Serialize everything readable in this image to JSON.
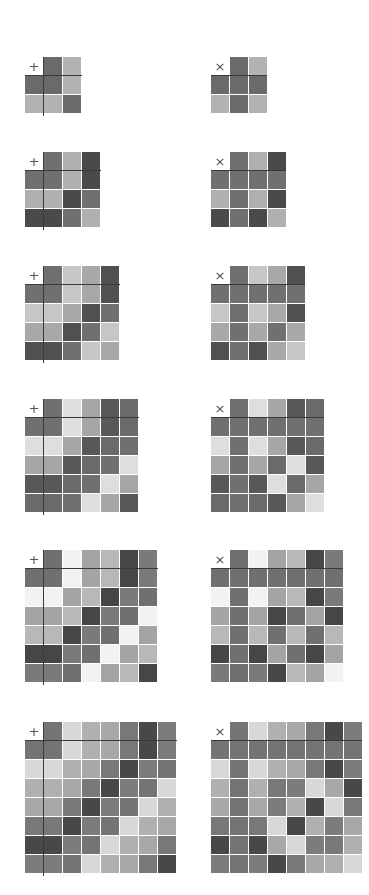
{
  "layout": {
    "columns_x": [
      25,
      211
    ],
    "rows_y": [
      57,
      152,
      266,
      399,
      550,
      722
    ],
    "cell_size": 18,
    "gap": 1
  },
  "tables": [
    {
      "n": 2,
      "palette": [
        "#6a6a6a",
        "#b2b2b2"
      ]
    },
    {
      "n": 3,
      "palette": [
        "#707070",
        "#b0b0b0",
        "#4a4a4a"
      ]
    },
    {
      "n": 4,
      "palette": [
        "#707070",
        "#c6c6c6",
        "#a8a8a8",
        "#505050"
      ]
    },
    {
      "n": 5,
      "palette": [
        "#707070",
        "#dedede",
        "#a6a6a6",
        "#585858",
        "#6a6a6a"
      ]
    },
    {
      "n": 6,
      "palette": [
        "#707070",
        "#f2f2f2",
        "#a4a4a4",
        "#b8b8b8",
        "#464646",
        "#7a7a7a"
      ]
    },
    {
      "n": 7,
      "palette": [
        "#747474",
        "#d8d8d8",
        "#b0b0b0",
        "#a8a8a8",
        "#787878",
        "#484848",
        "#7c7c7c"
      ]
    }
  ],
  "operations": [
    {
      "symbol": "+",
      "name": "addition",
      "line_style": "cross"
    },
    {
      "symbol": "×",
      "name": "multiplication",
      "line_style": "header-row"
    }
  ]
}
